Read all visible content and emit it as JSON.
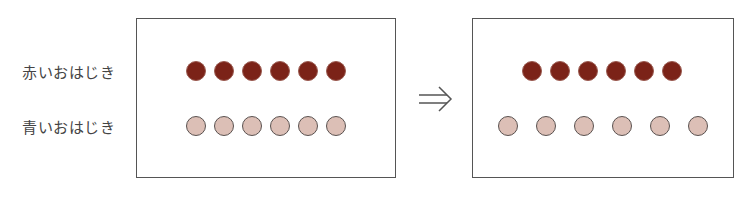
{
  "labels": {
    "red": "赤いおはじき",
    "blue": "青いおはじき"
  },
  "arrow": "⇒",
  "colors": {
    "red_marble": "#7b2318",
    "blue_marble": "#dcbfb6",
    "border": "#555555"
  },
  "before": {
    "red_count": 6,
    "blue_count": 6,
    "red_x": [
      196,
      224,
      252,
      280,
      308,
      336
    ],
    "blue_x": [
      196,
      224,
      252,
      280,
      308,
      336
    ]
  },
  "after": {
    "red_count": 6,
    "blue_count": 6,
    "red_x": [
      532,
      560,
      588,
      616,
      644,
      672
    ],
    "blue_x": [
      508,
      546,
      584,
      622,
      660,
      698
    ]
  }
}
